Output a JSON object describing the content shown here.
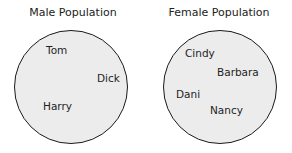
{
  "left": {
    "title": "Male Population",
    "members": [
      "Tom",
      "Dick",
      "Harry"
    ]
  },
  "right": {
    "title": "Female Population",
    "members": [
      "Cindy",
      "Barbara",
      "Dani",
      "Nancy"
    ]
  },
  "colors": {
    "circle_fill": "#ececec",
    "circle_stroke": "#1a1a1a",
    "text": "#222222"
  }
}
